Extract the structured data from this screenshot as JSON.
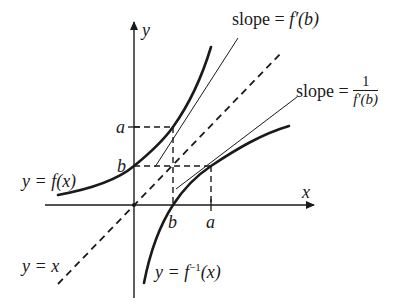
{
  "diagram": {
    "axes": {
      "x_label": "x",
      "y_label": "y",
      "x_ticks": [
        "b",
        "a"
      ],
      "y_ticks": [
        "a",
        "b"
      ]
    },
    "curves": {
      "f_label": "y = f(x)",
      "f_inverse_label_prefix": "y = f",
      "f_inverse_sup": "−1",
      "f_inverse_label_suffix": "(x)",
      "identity_label": "y = x"
    },
    "annotations": {
      "slope_f_prefix": "slope = ",
      "slope_f_value": "f′(b)",
      "slope_inv_prefix": "slope = ",
      "slope_inv_numerator": "1",
      "slope_inv_denominator": "f′(b)"
    },
    "colors": {
      "ink": "#1a1a1a",
      "background": "#ffffff"
    }
  }
}
